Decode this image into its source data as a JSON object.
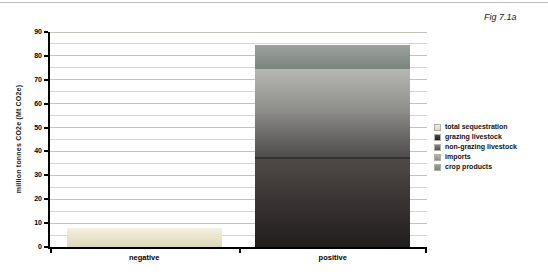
{
  "figure": {
    "label": "Fig 7.1a"
  },
  "chart_data": {
    "type": "bar",
    "stacked": true,
    "title": "",
    "xlabel": "",
    "ylabel": "million tonnes CO2e (Mt CO2e)",
    "ylim": [
      0,
      90
    ],
    "yticks": [
      0,
      10,
      20,
      30,
      40,
      50,
      60,
      70,
      80,
      90
    ],
    "ytick_step": 10,
    "grid_step": 5,
    "grid_on": true,
    "legend_position": "right",
    "categories": [
      "negative",
      "positive"
    ],
    "series": [
      {
        "name": "total sequestration",
        "values": [
          8,
          0
        ],
        "fill": [
          "#f4f1e0",
          "#ddd6b6"
        ],
        "swatch": "#ece7d2"
      },
      {
        "name": "grazing livestock",
        "values": [
          0,
          37.5
        ],
        "fill": [
          "#4f4a47",
          "#211d1d"
        ],
        "swatch": "#3e3937",
        "edge_top": "#343030"
      },
      {
        "name": "non-grazing livestock",
        "values": [
          0,
          18.5
        ],
        "fill": [
          "#8a8886",
          "#4e4c4c"
        ],
        "swatch": "#6a6866"
      },
      {
        "name": "imports",
        "values": [
          0,
          18.5
        ],
        "fill": [
          "#b7b7b4",
          "#8b8b88"
        ],
        "swatch": "#a0a09d"
      },
      {
        "name": "crop products",
        "values": [
          0,
          10
        ],
        "fill": [
          "#99a29d",
          "#7b847f"
        ],
        "swatch": "#8b948f"
      }
    ],
    "colors": {
      "grid_major": "#c4c4bb",
      "grid_minor": "#d7d7cf",
      "axis": "#000000"
    }
  }
}
